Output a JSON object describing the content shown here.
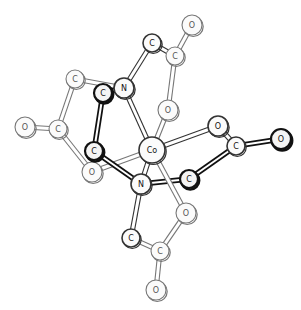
{
  "diagram": {
    "atoms": [
      {
        "id": "O1",
        "label": "O",
        "x": 192,
        "y": 25,
        "r": 10,
        "style": "light"
      },
      {
        "id": "C1",
        "label": "C",
        "x": 152,
        "y": 43,
        "r": 9,
        "style": "mid"
      },
      {
        "id": "C2",
        "label": "C",
        "x": 175,
        "y": 56,
        "r": 9,
        "style": "light"
      },
      {
        "id": "C3",
        "label": "C",
        "x": 75,
        "y": 79,
        "r": 9,
        "style": "light"
      },
      {
        "id": "C4",
        "label": "C",
        "x": 103,
        "y": 93,
        "r": 9,
        "style": "dark"
      },
      {
        "id": "N1",
        "label": "N",
        "x": 124,
        "y": 88,
        "r": 10,
        "style": "mid"
      },
      {
        "id": "O2",
        "label": "O",
        "x": 168,
        "y": 110,
        "r": 10,
        "style": "light"
      },
      {
        "id": "O3",
        "label": "O",
        "x": 25,
        "y": 127,
        "r": 10,
        "style": "light"
      },
      {
        "id": "C5",
        "label": "C",
        "x": 58,
        "y": 129,
        "r": 9,
        "style": "light"
      },
      {
        "id": "O4",
        "label": "O",
        "x": 218,
        "y": 126,
        "r": 10,
        "style": "mid"
      },
      {
        "id": "C6",
        "label": "C",
        "x": 94,
        "y": 151,
        "r": 9,
        "style": "dark"
      },
      {
        "id": "Co",
        "label": "Co",
        "x": 152,
        "y": 150,
        "r": 13,
        "style": "mid"
      },
      {
        "id": "C7",
        "label": "C",
        "x": 236,
        "y": 146,
        "r": 9,
        "style": "mid"
      },
      {
        "id": "O5",
        "label": "O",
        "x": 281,
        "y": 139,
        "r": 10,
        "style": "dark"
      },
      {
        "id": "O6",
        "label": "O",
        "x": 92,
        "y": 172,
        "r": 10,
        "style": "light"
      },
      {
        "id": "N2",
        "label": "N",
        "x": 141,
        "y": 184,
        "r": 10,
        "style": "mid"
      },
      {
        "id": "C8",
        "label": "C",
        "x": 189,
        "y": 179,
        "r": 9,
        "style": "dark"
      },
      {
        "id": "O7",
        "label": "O",
        "x": 186,
        "y": 213,
        "r": 10,
        "style": "light"
      },
      {
        "id": "C9",
        "label": "C",
        "x": 131,
        "y": 238,
        "r": 9,
        "style": "mid"
      },
      {
        "id": "C10",
        "label": "C",
        "x": 160,
        "y": 251,
        "r": 9,
        "style": "light"
      },
      {
        "id": "O8",
        "label": "O",
        "x": 156,
        "y": 290,
        "r": 10,
        "style": "light"
      }
    ],
    "bonds": [
      {
        "a": "O1",
        "b": "C2",
        "style": "light"
      },
      {
        "a": "C1",
        "b": "C2",
        "style": "mid"
      },
      {
        "a": "C1",
        "b": "N1",
        "style": "mid"
      },
      {
        "a": "C2",
        "b": "O2",
        "style": "light"
      },
      {
        "a": "O2",
        "b": "Co",
        "style": "light"
      },
      {
        "a": "C3",
        "b": "N1",
        "style": "light"
      },
      {
        "a": "C3",
        "b": "C5",
        "style": "light"
      },
      {
        "a": "O3",
        "b": "C5",
        "style": "light"
      },
      {
        "a": "C5",
        "b": "O6",
        "style": "light"
      },
      {
        "a": "O6",
        "b": "Co",
        "style": "light"
      },
      {
        "a": "C4",
        "b": "N1",
        "style": "dark"
      },
      {
        "a": "C4",
        "b": "C6",
        "style": "dark"
      },
      {
        "a": "C6",
        "b": "N2",
        "style": "dark"
      },
      {
        "a": "N1",
        "b": "Co",
        "style": "mid"
      },
      {
        "a": "Co",
        "b": "N2",
        "style": "mid"
      },
      {
        "a": "Co",
        "b": "O4",
        "style": "mid"
      },
      {
        "a": "O4",
        "b": "C7",
        "style": "mid"
      },
      {
        "a": "C7",
        "b": "O5",
        "style": "dark"
      },
      {
        "a": "C7",
        "b": "C8",
        "style": "dark"
      },
      {
        "a": "N2",
        "b": "C8",
        "style": "dark"
      },
      {
        "a": "Co",
        "b": "O7",
        "style": "light"
      },
      {
        "a": "N2",
        "b": "C9",
        "style": "mid"
      },
      {
        "a": "C9",
        "b": "C10",
        "style": "light"
      },
      {
        "a": "C10",
        "b": "O7",
        "style": "light"
      },
      {
        "a": "C10",
        "b": "O8",
        "style": "light"
      }
    ]
  }
}
